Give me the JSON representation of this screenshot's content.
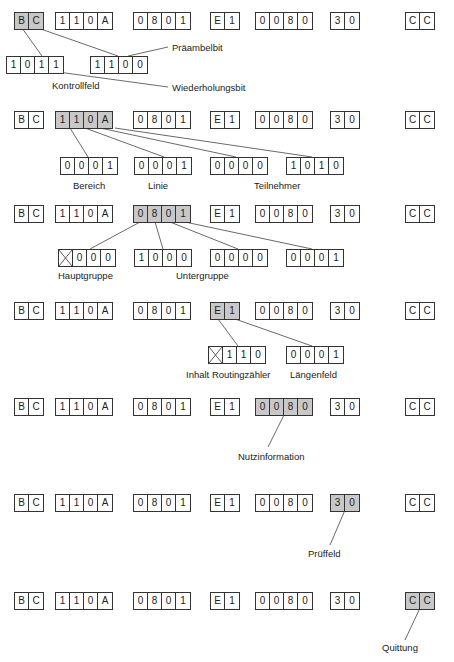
{
  "colors": {
    "highlight": "#c8c8c8",
    "border": "#333333",
    "background": "#ffffff"
  },
  "frame_fields": [
    {
      "id": "bc",
      "cells": [
        "B",
        "C"
      ]
    },
    {
      "id": "addr",
      "cells": [
        "1",
        "1",
        "0",
        "A"
      ]
    },
    {
      "id": "group",
      "cells": [
        "0",
        "8",
        "0",
        "1"
      ]
    },
    {
      "id": "e1",
      "cells": [
        "E",
        "1"
      ]
    },
    {
      "id": "data",
      "cells": [
        "0",
        "0",
        "8",
        "0"
      ]
    },
    {
      "id": "check",
      "cells": [
        "3",
        "0"
      ]
    },
    {
      "id": "ack",
      "cells": [
        "C",
        "C"
      ]
    }
  ],
  "rows": [
    {
      "highlight": "bc",
      "sub_fields": [
        {
          "cells": [
            "1",
            "0",
            "1",
            "1"
          ]
        },
        {
          "cells": [
            "1",
            "1",
            "0",
            "0"
          ]
        }
      ],
      "labels": [
        "Präambelbit",
        "Kontrollfeld",
        "Wiederholungsbit"
      ]
    },
    {
      "highlight": "addr",
      "sub_fields": [
        {
          "cells": [
            "0",
            "0",
            "0",
            "1"
          ]
        },
        {
          "cells": [
            "0",
            "0",
            "0",
            "1"
          ]
        },
        {
          "cells": [
            "0",
            "0",
            "0",
            "0"
          ]
        },
        {
          "cells": [
            "1",
            "0",
            "1",
            "0"
          ]
        }
      ],
      "labels": [
        "Bereich",
        "Linie",
        "Teilnehmer"
      ]
    },
    {
      "highlight": "group",
      "sub_fields": [
        {
          "cells": [
            "⊠",
            "0",
            "0",
            "0"
          ]
        },
        {
          "cells": [
            "1",
            "0",
            "0",
            "0"
          ]
        },
        {
          "cells": [
            "0",
            "0",
            "0",
            "0"
          ]
        },
        {
          "cells": [
            "0",
            "0",
            "0",
            "1"
          ]
        }
      ],
      "labels": [
        "Hauptgruppe",
        "Untergruppe"
      ]
    },
    {
      "highlight": "e1",
      "sub_fields": [
        {
          "cells": [
            "⊠",
            "1",
            "1",
            "0"
          ]
        },
        {
          "cells": [
            "0",
            "0",
            "0",
            "1"
          ]
        }
      ],
      "labels": [
        "Inhalt Routingzähler",
        "Längenfeld"
      ]
    },
    {
      "highlight": "data",
      "labels": [
        "Nutzinformation"
      ]
    },
    {
      "highlight": "check",
      "labels": [
        "Prüffeld"
      ]
    },
    {
      "highlight": "ack",
      "labels": [
        "Quittung"
      ]
    }
  ]
}
